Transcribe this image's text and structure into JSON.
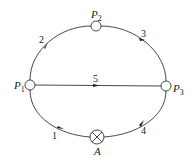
{
  "diagram": {
    "nodes": [
      {
        "id": "P1",
        "label": "P",
        "sub": "1",
        "x": 30,
        "y": 85
      },
      {
        "id": "P2",
        "label": "P",
        "sub": "2",
        "x": 96,
        "y": 26
      },
      {
        "id": "P3",
        "label": "P",
        "sub": "3",
        "x": 166,
        "y": 86
      },
      {
        "id": "A",
        "label": "A",
        "x": 97,
        "y": 137,
        "type": "pump"
      }
    ],
    "edges": [
      {
        "id": "1",
        "label": "1",
        "from": "A",
        "to": "P1"
      },
      {
        "id": "2",
        "label": "2",
        "from": "P1",
        "to": "P2"
      },
      {
        "id": "3",
        "label": "3",
        "from": "P2",
        "to": "P3"
      },
      {
        "id": "4",
        "label": "4",
        "from": "A",
        "to": "P3"
      },
      {
        "id": "5",
        "label": "5",
        "from": "P1",
        "to": "P3"
      }
    ]
  },
  "labels": {
    "p": "P",
    "p1_sub": "1",
    "p2_sub": "2",
    "p3_sub": "3",
    "a": "A",
    "e1": "1",
    "e2": "2",
    "e3": "3",
    "e4": "4",
    "e5": "5"
  }
}
